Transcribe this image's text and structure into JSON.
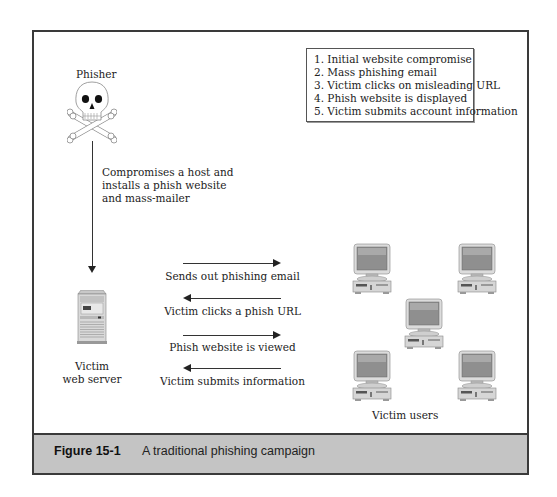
{
  "figure": {
    "caption_label": "Figure 15-1",
    "caption_text": "A traditional phishing campaign"
  },
  "legend": {
    "items": [
      "1. Initial website compromise",
      "2. Mass phishing email",
      "3. Victim clicks on misleading URL",
      "4. Phish website is displayed",
      "5. Victim submits account information"
    ]
  },
  "nodes": {
    "phisher": {
      "label": "Phisher",
      "icon": "skull-crossbones-icon"
    },
    "server": {
      "label_line1": "Victim",
      "label_line2": "web server",
      "icon": "server-tower-icon"
    },
    "users": {
      "label": "Victim users",
      "icon": "desktop-computer-icon",
      "count": 5
    }
  },
  "edges": {
    "compromise": {
      "line1": "Compromises a host and",
      "line2": "installs a phish website",
      "line3": "and mass-mailer",
      "direction": "down"
    },
    "flows": [
      {
        "label": "Sends out phishing email",
        "direction": "right"
      },
      {
        "label": "Victim clicks a phish URL",
        "direction": "left"
      },
      {
        "label": "Phish website is viewed",
        "direction": "right"
      },
      {
        "label": "Victim submits information",
        "direction": "left"
      }
    ]
  },
  "colors": {
    "caption_bar": "#c4c4c4",
    "frame_border": "#3a3a3a"
  }
}
